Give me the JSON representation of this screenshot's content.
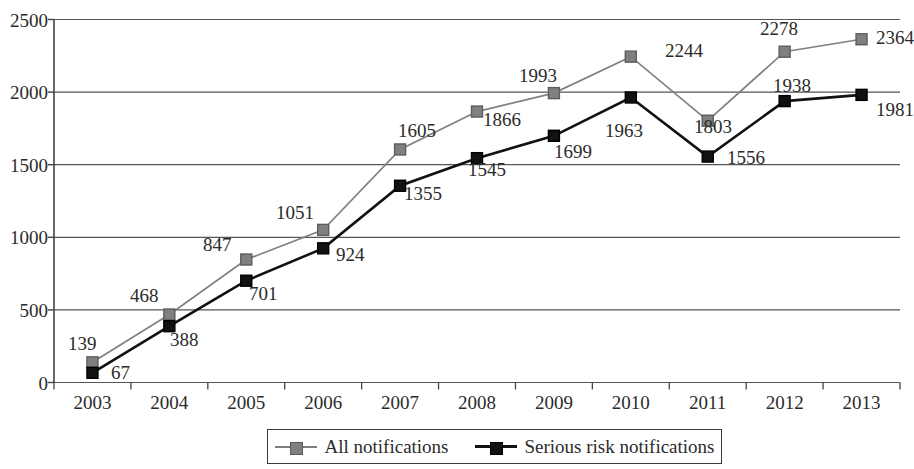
{
  "chart_data": {
    "type": "line",
    "title": "",
    "xlabel": "",
    "ylabel": "",
    "categories": [
      "2003",
      "2004",
      "2005",
      "2006",
      "2007",
      "2008",
      "2009",
      "2010",
      "2011",
      "2012",
      "2013"
    ],
    "series": [
      {
        "name": "All notifications",
        "color": "#808080",
        "marker": "square",
        "values": [
          139,
          468,
          847,
          1051,
          1605,
          1866,
          1993,
          2244,
          1803,
          2278,
          2364
        ]
      },
      {
        "name": "Serious risk notifications",
        "color": "#111111",
        "marker": "square",
        "values": [
          67,
          388,
          701,
          924,
          1355,
          1545,
          1699,
          1963,
          1556,
          1938,
          1981
        ]
      }
    ],
    "ylim": [
      0,
      2500
    ],
    "y_ticks": [
      "0",
      "500",
      "1000",
      "1500",
      "2000",
      "2500"
    ],
    "grid": "horizontal",
    "legend_position": "bottom"
  },
  "legend": {
    "entries": [
      {
        "label": "All notifications",
        "key": "gray-square-marker"
      },
      {
        "label": "Serious risk notifications",
        "key": "black-square-marker"
      }
    ]
  },
  "labels": {
    "all": [
      {
        "text": "139",
        "x": 68,
        "y": 334
      },
      {
        "text": "468",
        "x": 130,
        "y": 286
      },
      {
        "text": "847",
        "x": 203,
        "y": 235
      },
      {
        "text": "1051",
        "x": 276,
        "y": 203
      },
      {
        "text": "1605",
        "x": 398,
        "y": 121
      },
      {
        "text": "1866",
        "x": 483,
        "y": 110
      },
      {
        "text": "1993",
        "x": 519,
        "y": 66
      },
      {
        "text": "1993_dummy",
        "x": -999,
        "y": -999
      },
      {
        "text": "2244",
        "x": 665,
        "y": 41
      },
      {
        "text": "1803",
        "x": 694,
        "y": 117
      },
      {
        "text": "2278",
        "x": 760,
        "y": 19
      },
      {
        "text": "2364",
        "x": 876,
        "y": 28
      }
    ],
    "serious": [
      {
        "text": "67",
        "x": 111,
        "y": 363
      },
      {
        "text": "388",
        "x": 170,
        "y": 330
      },
      {
        "text": "701",
        "x": 249,
        "y": 284
      },
      {
        "text": "924",
        "x": 336,
        "y": 245
      },
      {
        "text": "1355",
        "x": 404,
        "y": 184
      },
      {
        "text": "1545",
        "x": 468,
        "y": 160
      },
      {
        "text": "1699",
        "x": 554,
        "y": 142
      },
      {
        "text": "1963",
        "x": 605,
        "y": 121
      },
      {
        "text": "1556",
        "x": 727,
        "y": 148
      },
      {
        "text": "1938",
        "x": 773,
        "y": 76
      },
      {
        "text": "1981",
        "x": 876,
        "y": 100
      }
    ]
  },
  "axis": {
    "y_ticks": [
      "2500",
      "2000",
      "1500",
      "1000",
      "500",
      "0"
    ],
    "x_ticks": [
      "2003",
      "2004",
      "2005",
      "2006",
      "2007",
      "2008",
      "2009",
      "2010",
      "2011",
      "2012",
      "2013"
    ]
  }
}
